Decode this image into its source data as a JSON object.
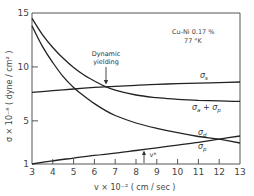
{
  "chart_data": {
    "type": "line",
    "title": "",
    "annotation_material": "Cu-Ni  0.17 %",
    "annotation_temperature": "77 °K",
    "xlabel": "v × 10⁻² ( cm / sec )",
    "ylabel": "σ × 10⁻⁸ ( dyne / cm² )",
    "xlim": [
      3,
      13
    ],
    "ylim": [
      1,
      15
    ],
    "xticks": [
      3,
      4,
      5,
      6,
      7,
      8,
      9,
      10,
      11,
      12,
      13
    ],
    "yticks": [
      1,
      5,
      10,
      15
    ],
    "grid": false,
    "legend": "inline labels",
    "series": [
      {
        "name": "σs",
        "label": "σ",
        "sub": "s",
        "x": [
          3,
          4,
          5,
          6,
          7,
          8,
          9,
          10,
          11,
          12,
          13
        ],
        "values": [
          7.65,
          7.8,
          7.95,
          8.1,
          8.2,
          8.3,
          8.38,
          8.45,
          8.5,
          8.55,
          8.6
        ]
      },
      {
        "name": "σa + σp",
        "label": "σ",
        "sub": "a",
        "label2": " + σ",
        "sub2": "p",
        "x": [
          3,
          3.5,
          4,
          4.5,
          5,
          5.5,
          6,
          6.5,
          7,
          8,
          9,
          10,
          11,
          12,
          13
        ],
        "values": [
          14.5,
          13.0,
          11.8,
          10.8,
          9.95,
          9.25,
          8.7,
          8.2,
          7.85,
          7.4,
          7.15,
          7.0,
          6.9,
          6.85,
          6.8
        ]
      },
      {
        "name": "σd",
        "label": "σ",
        "sub": "d",
        "x": [
          3,
          3.5,
          4,
          4.5,
          5,
          5.5,
          6,
          6.5,
          7,
          8,
          9,
          10,
          11,
          12,
          13
        ],
        "values": [
          13.8,
          11.9,
          10.4,
          9.1,
          8.1,
          7.3,
          6.6,
          6.0,
          5.5,
          4.8,
          4.3,
          3.9,
          3.55,
          3.3,
          2.95
        ]
      },
      {
        "name": "σp",
        "label": "σ",
        "sub": "p",
        "x": [
          3,
          4,
          5,
          6,
          7,
          8,
          9,
          10,
          11,
          12,
          13
        ],
        "values": [
          1.0,
          1.3,
          1.55,
          1.8,
          2.0,
          2.25,
          2.5,
          2.75,
          3.0,
          3.3,
          3.6
        ]
      }
    ],
    "annotations": [
      {
        "text": "Dynamic",
        "text2": "yielding",
        "x": 6.4,
        "y": 8.2,
        "type": "arrow-down"
      },
      {
        "text": "v*",
        "x": 8.5,
        "y": 1.0,
        "type": "arrow-up"
      }
    ]
  }
}
